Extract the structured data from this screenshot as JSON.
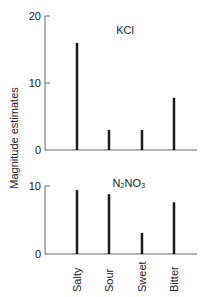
{
  "chart_data": [
    {
      "type": "bar",
      "title": "KCl",
      "categories": [
        "Salty",
        "Sour",
        "Sweet",
        "Bitter"
      ],
      "values": [
        16,
        3,
        3,
        7.8
      ],
      "xlabel": "",
      "ylabel": "Magnitude estimates",
      "ylim": [
        0,
        20
      ],
      "yticks": [
        0,
        10,
        20
      ],
      "grid": false,
      "legend": null
    },
    {
      "type": "bar",
      "title": "N2NO3",
      "title_display": "N₂NO₃",
      "categories": [
        "Salty",
        "Sour",
        "Sweet",
        "Bitter"
      ],
      "values": [
        9.4,
        8.8,
        3.1,
        7.6
      ],
      "xlabel": "",
      "ylabel": "Magnitude estimates",
      "ylim": [
        0,
        10
      ],
      "yticks": [
        0,
        10
      ],
      "grid": false,
      "legend": null
    }
  ],
  "axis": {
    "ylabel": "Magnitude estimates",
    "categories": [
      "Salty",
      "Sour",
      "Sweet",
      "Bitter"
    ]
  },
  "panels": {
    "top": {
      "title": "KCl",
      "ticks": [
        "20",
        "10",
        "0"
      ]
    },
    "bottom": {
      "title": "N₂NO₃",
      "ticks": [
        "10",
        "0"
      ]
    }
  },
  "colors": {
    "bar": "#1a1a1a",
    "axis": "#555555"
  }
}
